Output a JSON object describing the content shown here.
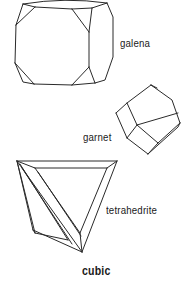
{
  "figure": {
    "title": "cubic",
    "line_color": "#2a2a2a",
    "background": "#ffffff"
  },
  "crystals": [
    {
      "name": "galena",
      "label": "galena",
      "shape": "cuboctahedral-cube"
    },
    {
      "name": "garnet",
      "label": "garnet",
      "shape": "rhombic-dodecahedron"
    },
    {
      "name": "tetrahedrite",
      "label": "tetrahedrite",
      "shape": "truncated-tetrahedron"
    }
  ]
}
